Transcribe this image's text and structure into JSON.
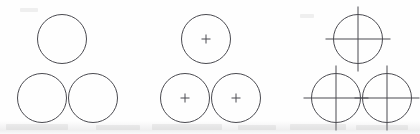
{
  "figure": {
    "background_color": "#fefefe",
    "line_color": "#4a4a50",
    "line_width": 1,
    "width": 420,
    "height": 134,
    "groups": [
      {
        "id": "group-plain",
        "label": "Circles without center marks",
        "mark_style": "none",
        "circles": [
          {
            "id": "plain-top",
            "label": "top circle",
            "cx": 62,
            "cy": 39,
            "r": 24.5
          },
          {
            "id": "plain-bottom-left",
            "label": "bottom-left circle",
            "cx": 42,
            "cy": 98,
            "r": 24.5
          },
          {
            "id": "plain-bottom-right",
            "label": "bottom-right circle",
            "cx": 93,
            "cy": 98,
            "r": 24.5
          }
        ]
      },
      {
        "id": "group-plus",
        "label": "Circles with small center plus marks",
        "mark_style": "small-plus",
        "mark_arm_length": 4.5,
        "circles": [
          {
            "id": "plus-top",
            "label": "top circle",
            "cx": 206,
            "cy": 39,
            "r": 24.5
          },
          {
            "id": "plus-bottom-left",
            "label": "bottom-left circle",
            "cx": 185,
            "cy": 98,
            "r": 24.5
          },
          {
            "id": "plus-bottom-right",
            "label": "bottom-right circle",
            "cx": 236,
            "cy": 98,
            "r": 24.5
          }
        ]
      },
      {
        "id": "group-centerlines",
        "label": "Circles with full center lines extending past the circumference",
        "mark_style": "center-lines",
        "mark_overrun": 8,
        "circles": [
          {
            "id": "cross-top",
            "label": "top circle",
            "cx": 358,
            "cy": 39,
            "r": 24.5
          },
          {
            "id": "cross-bottom-left",
            "label": "bottom-left circle",
            "cx": 336,
            "cy": 98,
            "r": 24.5
          },
          {
            "id": "cross-bottom-right",
            "label": "bottom-right circle",
            "cx": 387,
            "cy": 98,
            "r": 24.5
          }
        ]
      }
    ]
  },
  "artifacts": {
    "label": "faint scanned-page ghosting along the bottom edge",
    "specks": [
      {
        "x": 6,
        "y": 124,
        "w": 62,
        "h": 6
      },
      {
        "x": 96,
        "y": 125,
        "w": 44,
        "h": 5
      },
      {
        "x": 152,
        "y": 124,
        "w": 70,
        "h": 6
      },
      {
        "x": 238,
        "y": 125,
        "w": 38,
        "h": 5
      },
      {
        "x": 290,
        "y": 124,
        "w": 56,
        "h": 6
      },
      {
        "x": 356,
        "y": 125,
        "w": 52,
        "h": 5
      },
      {
        "x": 20,
        "y": 8,
        "w": 18,
        "h": 4
      },
      {
        "x": 300,
        "y": 14,
        "w": 14,
        "h": 4
      }
    ]
  }
}
